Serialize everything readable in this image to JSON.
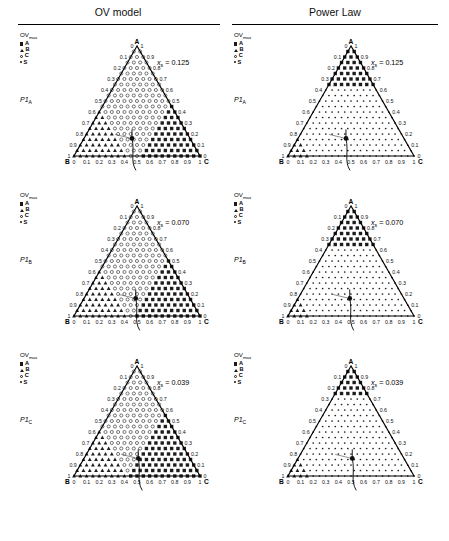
{
  "figure": {
    "columns": [
      {
        "id": "ov",
        "title": "OV model"
      },
      {
        "id": "pl",
        "title": "Power Law"
      }
    ],
    "legend": {
      "title": "OV",
      "title_sub": "max",
      "entries": [
        {
          "marker": "filled-square",
          "label": "A"
        },
        {
          "marker": "filled-triangle",
          "label": "B"
        },
        {
          "marker": "open-circle",
          "label": "C"
        },
        {
          "marker": "small-dot",
          "label": "S"
        }
      ]
    },
    "ternary": {
      "vertex_top": "A",
      "vertex_left": "B",
      "vertex_right": "C",
      "ticks": [
        "0",
        "0.1",
        "0.2",
        "0.3",
        "0.4",
        "0.5",
        "0.6",
        "0.7",
        "0.8",
        "0.9",
        "1"
      ],
      "left_axis_ticks": [
        "0",
        "0.1",
        "0.2",
        "0.3",
        "0.4",
        "0.5",
        "0.6",
        "0.7",
        "0.8",
        "0.9",
        "1"
      ],
      "right_axis_ticks": [
        "1",
        "0.9",
        "0.8",
        "0.7",
        "0.6",
        "0.5",
        "0.4",
        "0.3",
        "0.2",
        "0.1",
        "0"
      ],
      "bottom_axis_ticks": [
        "0",
        "0.1",
        "0.2",
        "0.3",
        "0.4",
        "0.5",
        "0.6",
        "0.7",
        "0.8",
        "0.9",
        "1"
      ]
    },
    "rows": [
      {
        "id": "row1",
        "p_label": "P1",
        "p_sub": "A",
        "xs_symbol": "x",
        "xs_sub": "s",
        "xs_eq": "= 0.125",
        "xs_value": 0.125
      },
      {
        "id": "row2",
        "p_label": "P1",
        "p_sub": "B",
        "xs_symbol": "x",
        "xs_sub": "s",
        "xs_eq": "= 0.070",
        "xs_value": 0.07
      },
      {
        "id": "row3",
        "p_label": "P1",
        "p_sub": "C",
        "xs_symbol": "x",
        "xs_sub": "s",
        "xs_eq": "= 0.039",
        "xs_value": 0.039
      }
    ]
  },
  "chart_data": {
    "type": "scatter",
    "title": "",
    "subtitle": "",
    "xlabel": "",
    "ylabel": "",
    "grid": false,
    "legend_position": "top-left",
    "panels": [
      {
        "column": "OV model",
        "row_label": "P1_A",
        "xs": 0.125,
        "marker_counts": {
          "A": 61,
          "B": 118,
          "C": 141,
          "S": 0
        },
        "operating_point": {
          "b": 0.46,
          "c": 0.38,
          "a": 0.16
        }
      },
      {
        "column": "Power Law",
        "row_label": "P1_A",
        "xs": 0.125,
        "marker_counts": {
          "A": 36,
          "B": 9,
          "C": 0,
          "S": 275
        },
        "operating_point": {
          "b": 0.46,
          "c": 0.38,
          "a": 0.16
        }
      },
      {
        "column": "OV model",
        "row_label": "P1_B",
        "xs": 0.07,
        "marker_counts": {
          "A": 55,
          "B": 110,
          "C": 155,
          "S": 0
        },
        "operating_point": {
          "b": 0.43,
          "c": 0.41,
          "a": 0.16
        }
      },
      {
        "column": "Power Law",
        "row_label": "P1_B",
        "xs": 0.07,
        "marker_counts": {
          "A": 30,
          "B": 6,
          "C": 0,
          "S": 284
        },
        "operating_point": {
          "b": 0.43,
          "c": 0.41,
          "a": 0.16
        }
      },
      {
        "column": "OV model",
        "row_label": "P1_C",
        "xs": 0.039,
        "marker_counts": {
          "A": 48,
          "B": 104,
          "C": 168,
          "S": 0
        },
        "operating_point": {
          "b": 0.41,
          "c": 0.43,
          "a": 0.16
        }
      },
      {
        "column": "Power Law",
        "row_label": "P1_C",
        "xs": 0.039,
        "marker_counts": {
          "A": 24,
          "B": 4,
          "C": 0,
          "S": 292
        },
        "operating_point": {
          "b": 0.41,
          "c": 0.43,
          "a": 0.16
        }
      }
    ],
    "axes": {
      "A": {
        "range": [
          0,
          1
        ],
        "ticks": [
          0,
          0.1,
          0.2,
          0.3,
          0.4,
          0.5,
          0.6,
          0.7,
          0.8,
          0.9,
          1
        ]
      },
      "B": {
        "range": [
          0,
          1
        ],
        "ticks": [
          0,
          0.1,
          0.2,
          0.3,
          0.4,
          0.5,
          0.6,
          0.7,
          0.8,
          0.9,
          1
        ]
      },
      "C": {
        "range": [
          0,
          1
        ],
        "ticks": [
          0,
          0.1,
          0.2,
          0.3,
          0.4,
          0.5,
          0.6,
          0.7,
          0.8,
          0.9,
          1
        ]
      }
    }
  }
}
